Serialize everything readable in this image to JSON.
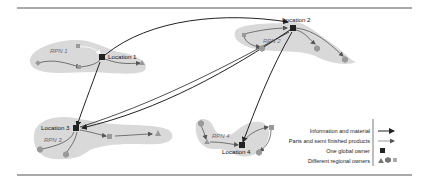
{
  "diagram": {
    "locations": [
      {
        "id": "loc1",
        "label": "Location 1",
        "network": "RPN 1"
      },
      {
        "id": "loc2",
        "label": "Location 2",
        "network": "RPN 2"
      },
      {
        "id": "loc3",
        "label": "Location 3",
        "network": "RPN 3"
      },
      {
        "id": "loc4",
        "label": "Location 4",
        "network": "RPN 4"
      }
    ],
    "global_links": [
      [
        "Location 1",
        "Location 2"
      ],
      [
        "Location 1",
        "Location 3"
      ],
      [
        "Location 2",
        "Location 3"
      ],
      [
        "Location 2",
        "Location 4"
      ]
    ]
  },
  "legend": {
    "items": [
      {
        "label": "Information and material",
        "symbol": "thick-arrow"
      },
      {
        "label": "Parts and semi finished products",
        "symbol": "thin-arrow"
      },
      {
        "label": "One global owner",
        "symbol": "square"
      },
      {
        "label": "Different regional owners",
        "symbol": "triangle-hexagon-square"
      }
    ]
  },
  "colors": {
    "region_fill": "#d9d9d9",
    "node_dark": "#222222",
    "node_regional": "#8a8a8a",
    "rule": "#555555"
  }
}
